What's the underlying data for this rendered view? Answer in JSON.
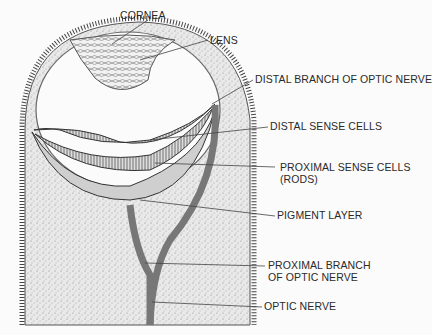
{
  "figure": {
    "labels": {
      "cornea": "CORNEA",
      "lens": "LENS",
      "distal_branch": "DISTAL BRANCH OF OPTIC NERVE",
      "distal_sense_cells": "DISTAL SENSE CELLS",
      "proximal_sense_cells_1": "PROXIMAL SENSE CELLS",
      "proximal_sense_cells_2": "(RODS)",
      "pigment_layer": "PIGMENT LAYER",
      "proximal_branch_1": "PROXIMAL BRANCH",
      "proximal_branch_2": "OF OPTIC NERVE",
      "optic_nerve": "OPTIC NERVE"
    }
  }
}
